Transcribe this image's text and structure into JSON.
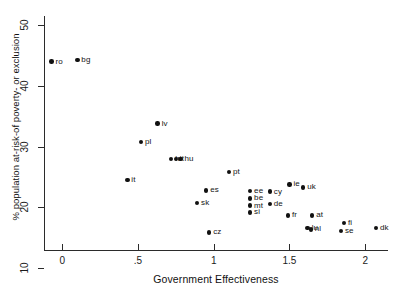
{
  "chart_data": {
    "type": "scatter",
    "title": "",
    "xlabel": "Government Effectiveness",
    "ylabel": "% population at-risk-of poverty- or exclusion",
    "xlim": [
      -0.12,
      2.15
    ],
    "ylim": [
      13.0,
      51.5
    ],
    "xticks": [
      "0",
      ".5",
      "1",
      "1.5",
      "2"
    ],
    "xtick_values": [
      0,
      0.5,
      1,
      1.5,
      2
    ],
    "yticks": [
      "10",
      "20",
      "30",
      "40",
      "50"
    ],
    "ytick_values": [
      10,
      20,
      30,
      40,
      50
    ],
    "grid": false,
    "legend": null,
    "marker": "filled-circle",
    "marker_color": "#111111",
    "points": [
      {
        "label": "ro",
        "x": -0.07,
        "y": 44.0
      },
      {
        "label": "bg",
        "x": 0.1,
        "y": 44.3
      },
      {
        "label": "lv",
        "x": 0.63,
        "y": 33.8
      },
      {
        "label": "pl",
        "x": 0.52,
        "y": 30.8
      },
      {
        "label": "hr",
        "x": 0.72,
        "y": 28.0
      },
      {
        "label": "lt",
        "x": 0.75,
        "y": 28.0
      },
      {
        "label": "hu",
        "x": 0.78,
        "y": 28.0
      },
      {
        "label": "it",
        "x": 0.43,
        "y": 24.5
      },
      {
        "label": "pt",
        "x": 1.1,
        "y": 25.8
      },
      {
        "label": "es",
        "x": 0.95,
        "y": 22.8
      },
      {
        "label": "ie",
        "x": 1.5,
        "y": 23.8
      },
      {
        "label": "uk",
        "x": 1.59,
        "y": 23.3
      },
      {
        "label": "cy",
        "x": 1.37,
        "y": 22.6
      },
      {
        "label": "ee",
        "x": 1.24,
        "y": 22.7
      },
      {
        "label": "be",
        "x": 1.24,
        "y": 21.5
      },
      {
        "label": "de",
        "x": 1.37,
        "y": 20.6
      },
      {
        "label": "mt",
        "x": 1.24,
        "y": 20.3
      },
      {
        "label": "sk",
        "x": 0.89,
        "y": 20.7
      },
      {
        "label": "si",
        "x": 1.24,
        "y": 19.2
      },
      {
        "label": "fr",
        "x": 1.49,
        "y": 18.7
      },
      {
        "label": "at",
        "x": 1.65,
        "y": 18.7
      },
      {
        "label": "lu",
        "x": 1.62,
        "y": 16.6
      },
      {
        "label": "nl",
        "x": 1.64,
        "y": 16.4
      },
      {
        "label": "cz",
        "x": 0.97,
        "y": 15.9
      },
      {
        "label": "fi",
        "x": 1.86,
        "y": 17.4
      },
      {
        "label": "se",
        "x": 1.84,
        "y": 16.1
      },
      {
        "label": "dk",
        "x": 2.07,
        "y": 16.6
      }
    ]
  }
}
